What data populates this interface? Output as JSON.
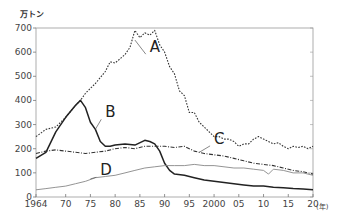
{
  "chart_data": {
    "type": "line",
    "title": "",
    "ylabel": "万トン",
    "xlabel": "(年)",
    "ylim": [
      0,
      700
    ],
    "xlim": [
      1964,
      2020
    ],
    "grid": false,
    "y_ticks": [
      0,
      100,
      200,
      300,
      400,
      500,
      600,
      700
    ],
    "x_ticks": [
      1964,
      1970,
      1975,
      1980,
      1985,
      1990,
      1995,
      2000,
      2005,
      2010,
      2015,
      2020
    ],
    "x_tick_labels": [
      "1964",
      "70",
      "75",
      "80",
      "85",
      "90",
      "95",
      "2000",
      "05",
      "10",
      "15",
      "20"
    ],
    "legend": "inline labels A, B, C, D",
    "series": [
      {
        "name": "A",
        "style": "dotted",
        "color": "#333333",
        "points": [
          [
            1964,
            250
          ],
          [
            1966,
            280
          ],
          [
            1968,
            290
          ],
          [
            1970,
            330
          ],
          [
            1972,
            380
          ],
          [
            1973,
            400
          ],
          [
            1974,
            430
          ],
          [
            1976,
            470
          ],
          [
            1978,
            520
          ],
          [
            1979,
            560
          ],
          [
            1980,
            555
          ],
          [
            1982,
            590
          ],
          [
            1983,
            620
          ],
          [
            1984,
            690
          ],
          [
            1985,
            660
          ],
          [
            1986,
            680
          ],
          [
            1987,
            670
          ],
          [
            1988,
            690
          ],
          [
            1989,
            630
          ],
          [
            1990,
            600
          ],
          [
            1991,
            540
          ],
          [
            1992,
            510
          ],
          [
            1993,
            440
          ],
          [
            1994,
            420
          ],
          [
            1995,
            350
          ],
          [
            1996,
            350
          ],
          [
            1997,
            310
          ],
          [
            1998,
            290
          ],
          [
            1999,
            270
          ],
          [
            2000,
            250
          ],
          [
            2001,
            250
          ],
          [
            2002,
            240
          ],
          [
            2003,
            240
          ],
          [
            2004,
            230
          ],
          [
            2005,
            210
          ],
          [
            2006,
            220
          ],
          [
            2007,
            220
          ],
          [
            2008,
            240
          ],
          [
            2009,
            250
          ],
          [
            2010,
            240
          ],
          [
            2011,
            230
          ],
          [
            2012,
            220
          ],
          [
            2013,
            225
          ],
          [
            2014,
            210
          ],
          [
            2015,
            200
          ],
          [
            2016,
            210
          ],
          [
            2017,
            205
          ],
          [
            2018,
            210
          ],
          [
            2019,
            200
          ],
          [
            2020,
            210
          ]
        ]
      },
      {
        "name": "B",
        "style": "solid",
        "color": "#222222",
        "points": [
          [
            1964,
            160
          ],
          [
            1966,
            185
          ],
          [
            1968,
            270
          ],
          [
            1970,
            330
          ],
          [
            1972,
            380
          ],
          [
            1973,
            400
          ],
          [
            1974,
            370
          ],
          [
            1975,
            310
          ],
          [
            1976,
            280
          ],
          [
            1977,
            230
          ],
          [
            1978,
            210
          ],
          [
            1979,
            210
          ],
          [
            1980,
            215
          ],
          [
            1982,
            220
          ],
          [
            1984,
            215
          ],
          [
            1986,
            235
          ],
          [
            1987,
            230
          ],
          [
            1988,
            220
          ],
          [
            1989,
            190
          ],
          [
            1990,
            140
          ],
          [
            1991,
            110
          ],
          [
            1992,
            95
          ],
          [
            1994,
            90
          ],
          [
            1996,
            80
          ],
          [
            1998,
            70
          ],
          [
            2000,
            65
          ],
          [
            2002,
            60
          ],
          [
            2004,
            55
          ],
          [
            2006,
            50
          ],
          [
            2008,
            45
          ],
          [
            2010,
            45
          ],
          [
            2012,
            40
          ],
          [
            2014,
            38
          ],
          [
            2016,
            35
          ],
          [
            2018,
            33
          ],
          [
            2020,
            30
          ]
        ]
      },
      {
        "name": "C",
        "style": "dash-dot",
        "color": "#333333",
        "points": [
          [
            1964,
            180
          ],
          [
            1966,
            190
          ],
          [
            1968,
            195
          ],
          [
            1970,
            190
          ],
          [
            1972,
            185
          ],
          [
            1974,
            180
          ],
          [
            1976,
            185
          ],
          [
            1978,
            190
          ],
          [
            1980,
            200
          ],
          [
            1982,
            205
          ],
          [
            1984,
            200
          ],
          [
            1986,
            210
          ],
          [
            1988,
            210
          ],
          [
            1990,
            210
          ],
          [
            1992,
            205
          ],
          [
            1994,
            210
          ],
          [
            1996,
            190
          ],
          [
            1998,
            180
          ],
          [
            2000,
            175
          ],
          [
            2002,
            170
          ],
          [
            2004,
            160
          ],
          [
            2006,
            150
          ],
          [
            2008,
            140
          ],
          [
            2010,
            135
          ],
          [
            2012,
            130
          ],
          [
            2014,
            120
          ],
          [
            2016,
            110
          ],
          [
            2018,
            105
          ],
          [
            2020,
            95
          ]
        ]
      },
      {
        "name": "D",
        "style": "solid-thin",
        "color": "#888888",
        "points": [
          [
            1964,
            30
          ],
          [
            1966,
            35
          ],
          [
            1968,
            40
          ],
          [
            1970,
            45
          ],
          [
            1972,
            55
          ],
          [
            1974,
            65
          ],
          [
            1976,
            80
          ],
          [
            1978,
            85
          ],
          [
            1980,
            90
          ],
          [
            1982,
            100
          ],
          [
            1984,
            110
          ],
          [
            1986,
            120
          ],
          [
            1988,
            125
          ],
          [
            1990,
            130
          ],
          [
            1992,
            130
          ],
          [
            1994,
            130
          ],
          [
            1996,
            135
          ],
          [
            1998,
            130
          ],
          [
            2000,
            130
          ],
          [
            2002,
            125
          ],
          [
            2004,
            120
          ],
          [
            2006,
            120
          ],
          [
            2008,
            115
          ],
          [
            2010,
            110
          ],
          [
            2011,
            95
          ],
          [
            2012,
            115
          ],
          [
            2014,
            110
          ],
          [
            2016,
            100
          ],
          [
            2018,
            100
          ],
          [
            2020,
            90
          ]
        ]
      }
    ],
    "annotations": [
      {
        "text": "A",
        "x": 1987,
        "y": 600,
        "leader_to": [
          1984,
          650
        ]
      },
      {
        "text": "B",
        "x": 1978,
        "y": 330,
        "leader_to": [
          1976,
          280
        ]
      },
      {
        "text": "C",
        "x": 2000,
        "y": 220,
        "leader_to": [
          1997,
          185
        ]
      },
      {
        "text": "D",
        "x": 1977,
        "y": 90,
        "leader_to": [
          1975,
          75
        ]
      }
    ]
  },
  "labels": {
    "unit": "万トン",
    "year_unit": "(年)"
  }
}
